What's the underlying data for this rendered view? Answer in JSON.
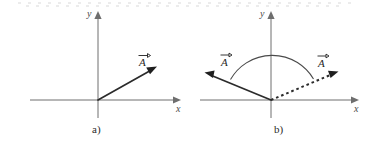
{
  "figure": {
    "background_color": "#ffffff",
    "axis_color": "#6e6e6e",
    "vector_color": "#1f1f1f",
    "arc_color": "#4a4a4a",
    "panels": [
      {
        "id": "a",
        "caption": "a)",
        "x_axis_label": "x",
        "y_axis_label": "y",
        "vectors": [
          {
            "label": "A",
            "style": "solid",
            "direction": "up-right",
            "label_overbar": "vector-arrow"
          }
        ],
        "arc": null
      },
      {
        "id": "b",
        "caption": "b)",
        "x_axis_label": "x",
        "y_axis_label": "y",
        "vectors": [
          {
            "label": "A",
            "style": "solid",
            "direction": "up-left",
            "label_overbar": "vector-arrow"
          },
          {
            "label": "A",
            "style": "dashed",
            "direction": "up-right",
            "label_overbar": "vector-arrow"
          }
        ],
        "arc": {
          "description": "angle-arc-between-vectors",
          "span": "semicircular"
        }
      }
    ]
  }
}
